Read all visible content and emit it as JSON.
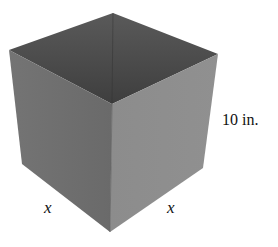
{
  "diagram": {
    "type": "open-top box",
    "labels": {
      "height": "10 in.",
      "left_base": "x",
      "right_base": "x"
    },
    "colors": {
      "interior": "#4d4d4d",
      "interior_back": "#3f3f3f",
      "left_face": "#6f6f6f",
      "right_face": "#8b8b8b",
      "edge": "#5a5a5a"
    }
  }
}
